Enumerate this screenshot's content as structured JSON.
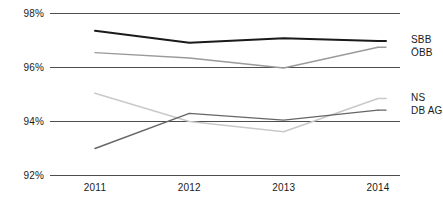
{
  "chart_data": {
    "type": "line",
    "title": "",
    "xlabel": "",
    "ylabel": "",
    "categories": [
      "2011",
      "2012",
      "2013",
      "2014"
    ],
    "x": [
      2011,
      2012,
      2013,
      2014
    ],
    "ylim": [
      92,
      98
    ],
    "yticks": [
      92,
      94,
      96,
      98
    ],
    "ytick_labels": [
      "92%",
      "94%",
      "96%",
      "98%"
    ],
    "grid": "horizontal",
    "legend_position": "right-inline-end-of-line",
    "series": [
      {
        "name": "SBB",
        "color": "#1a1a1a",
        "width": 2.0,
        "values": [
          97.36,
          96.92,
          97.08,
          96.98
        ]
      },
      {
        "name": "ÖBB",
        "color": "#9a9a9a",
        "width": 1.4,
        "values": [
          96.55,
          96.35,
          95.98,
          96.75
        ]
      },
      {
        "name": "NS",
        "color": "#c9c9c9",
        "width": 1.6,
        "values": [
          95.05,
          94.0,
          93.62,
          94.85
        ]
      },
      {
        "name": "DB AG",
        "color": "#666666",
        "width": 1.4,
        "values": [
          93.0,
          94.3,
          94.05,
          94.42
        ]
      }
    ]
  },
  "axes": {
    "y_tick_labels": [
      "98%",
      "96%",
      "94%",
      "92%"
    ],
    "x_tick_labels": [
      "2011",
      "2012",
      "2013",
      "2014"
    ]
  },
  "legend": {
    "items": [
      {
        "label": "SBB"
      },
      {
        "label": "ÖBB"
      },
      {
        "label": "NS"
      },
      {
        "label": "DB AG"
      }
    ]
  },
  "colors": {
    "gridline": "#4d4d4d",
    "background": "#ffffff",
    "text": "#1a1a1a"
  }
}
